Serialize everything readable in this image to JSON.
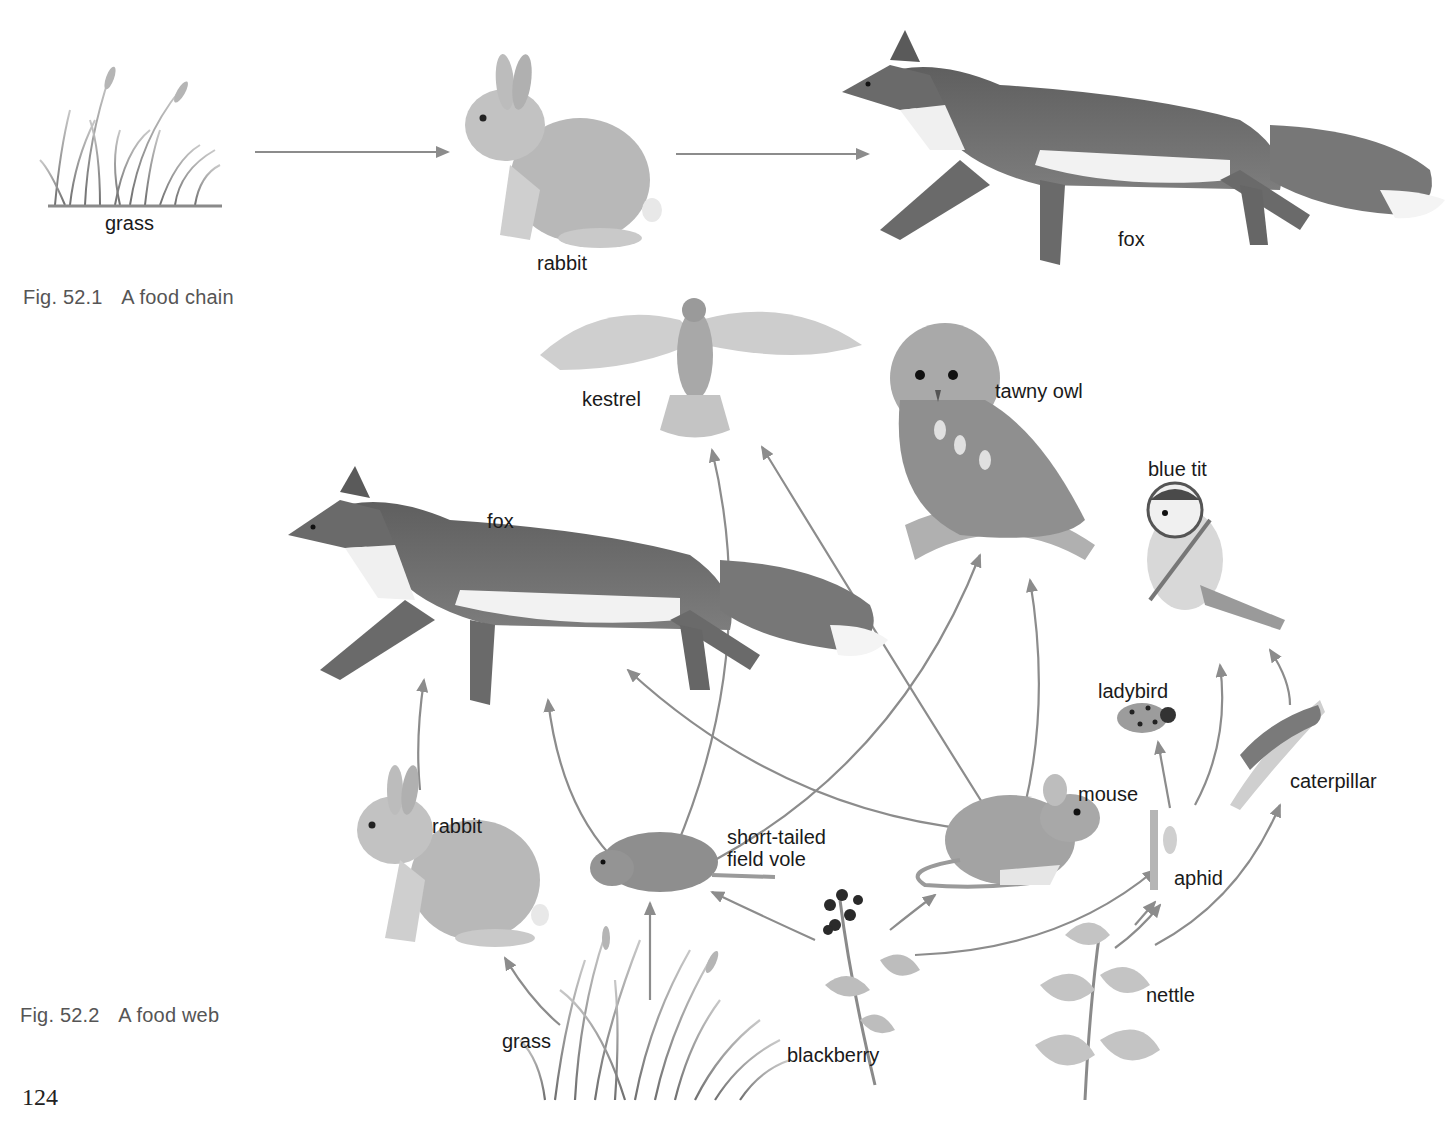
{
  "colors": {
    "arrow": "#8c8c8c",
    "fox_body": "#6e6e6e",
    "fox_white": "#f2f2f2",
    "fur_light": "#bdbdbd",
    "fur_mid": "#9a9a9a",
    "plant": "#8a8a8a",
    "caption": "#555555"
  },
  "figure_1": {
    "caption_number": "Fig. 52.1",
    "caption_title": "A food chain",
    "organisms": [
      {
        "id": "grass",
        "label": "grass"
      },
      {
        "id": "rabbit",
        "label": "rabbit"
      },
      {
        "id": "fox",
        "label": "fox"
      }
    ],
    "links": [
      {
        "from": "grass",
        "to": "rabbit"
      },
      {
        "from": "rabbit",
        "to": "fox"
      }
    ]
  },
  "figure_2": {
    "caption_number": "Fig. 52.2",
    "caption_title": "A food web",
    "organisms": [
      {
        "id": "kestrel",
        "label": "kestrel"
      },
      {
        "id": "tawny_owl",
        "label": "tawny owl"
      },
      {
        "id": "blue_tit",
        "label": "blue tit"
      },
      {
        "id": "fox",
        "label": "fox"
      },
      {
        "id": "ladybird",
        "label": "ladybird"
      },
      {
        "id": "mouse",
        "label": "mouse"
      },
      {
        "id": "caterpillar",
        "label": "caterpillar"
      },
      {
        "id": "rabbit",
        "label": "rabbit"
      },
      {
        "id": "vole_line1",
        "label": "short-tailed"
      },
      {
        "id": "vole_line2",
        "label": "field vole"
      },
      {
        "id": "aphid",
        "label": "aphid"
      },
      {
        "id": "nettle",
        "label": "nettle"
      },
      {
        "id": "grass",
        "label": "grass"
      },
      {
        "id": "blackberry",
        "label": "blackberry"
      }
    ],
    "links": [
      {
        "from": "grass",
        "to": "rabbit"
      },
      {
        "from": "grass",
        "to": "short-tailed field vole"
      },
      {
        "from": "blackberry",
        "to": "short-tailed field vole"
      },
      {
        "from": "blackberry",
        "to": "mouse"
      },
      {
        "from": "blackberry",
        "to": "aphid"
      },
      {
        "from": "nettle",
        "to": "aphid"
      },
      {
        "from": "nettle",
        "to": "caterpillar"
      },
      {
        "from": "rabbit",
        "to": "fox"
      },
      {
        "from": "short-tailed field vole",
        "to": "fox"
      },
      {
        "from": "short-tailed field vole",
        "to": "kestrel"
      },
      {
        "from": "short-tailed field vole",
        "to": "tawny owl"
      },
      {
        "from": "mouse",
        "to": "fox"
      },
      {
        "from": "mouse",
        "to": "kestrel"
      },
      {
        "from": "mouse",
        "to": "tawny owl"
      },
      {
        "from": "aphid",
        "to": "ladybird"
      },
      {
        "from": "aphid",
        "to": "blue tit"
      },
      {
        "from": "caterpillar",
        "to": "blue tit"
      }
    ]
  },
  "page_number": "124"
}
